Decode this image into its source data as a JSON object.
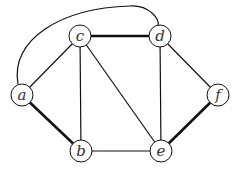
{
  "graph": {
    "colors": {
      "stroke": "#111111",
      "node_fill": "#ffffff",
      "label": "#333333"
    },
    "node_radius": 11,
    "nodes": [
      {
        "id": "a",
        "label": "a",
        "x": 22,
        "y": 95
      },
      {
        "id": "b",
        "label": "b",
        "x": 81,
        "y": 151
      },
      {
        "id": "c",
        "label": "c",
        "x": 80,
        "y": 36
      },
      {
        "id": "d",
        "label": "d",
        "x": 160,
        "y": 36
      },
      {
        "id": "e",
        "label": "e",
        "x": 161,
        "y": 151
      },
      {
        "id": "f",
        "label": "f",
        "x": 218,
        "y": 95
      }
    ],
    "edges": [
      {
        "from": "a",
        "to": "c",
        "bold": false
      },
      {
        "from": "a",
        "to": "d",
        "bold": false,
        "curved": true
      },
      {
        "from": "a",
        "to": "b",
        "bold": true
      },
      {
        "from": "c",
        "to": "b",
        "bold": false
      },
      {
        "from": "c",
        "to": "d",
        "bold": true
      },
      {
        "from": "c",
        "to": "e",
        "bold": false
      },
      {
        "from": "d",
        "to": "e",
        "bold": false
      },
      {
        "from": "d",
        "to": "f",
        "bold": false
      },
      {
        "from": "b",
        "to": "e",
        "bold": false
      },
      {
        "from": "e",
        "to": "f",
        "bold": true
      }
    ]
  }
}
